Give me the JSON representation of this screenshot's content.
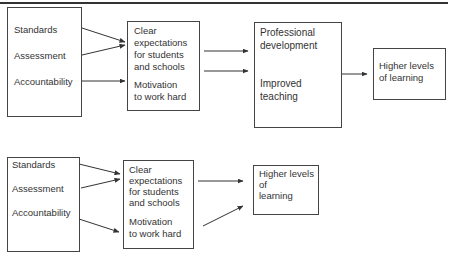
{
  "diagrams": [
    {
      "name": "four-stage-model",
      "inputs": [
        "Standards",
        "Assessment",
        "Accountability"
      ],
      "effects_box": {
        "block1": [
          "Clear",
          "expectations",
          "for students",
          "and schools"
        ],
        "block2": [
          "Motivation",
          "to work hard"
        ]
      },
      "mediators_box": {
        "block1": [
          "Professional",
          "development"
        ],
        "block2": [
          "Improved",
          "teaching"
        ]
      },
      "outcome": [
        "Higher levels",
        "of learning"
      ]
    },
    {
      "name": "three-stage-model",
      "inputs": [
        "Standards",
        "Assessment",
        "Accountability"
      ],
      "effects_box": {
        "block1": [
          "Clear",
          "expectations",
          "for students",
          "and schools"
        ],
        "block2": [
          "Motivation",
          "to work hard"
        ]
      },
      "outcome": [
        "Higher levels",
        "of",
        "learning"
      ]
    }
  ]
}
